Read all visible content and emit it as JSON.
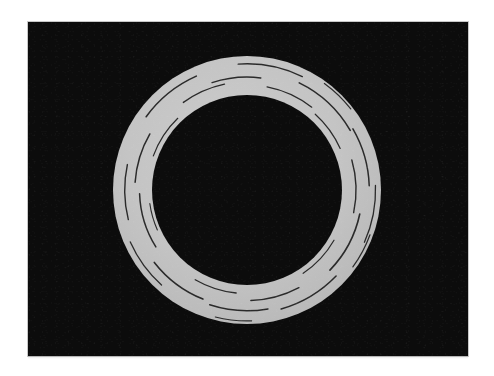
{
  "figure": {
    "caption": "",
    "media_type": "grayscale-photograph"
  },
  "page": {
    "background_color": "#ffffff",
    "border_color": "#c8c8c8"
  },
  "plate": {
    "label": "image-plate",
    "background_color": "#0c0c0c",
    "x": 28,
    "y": 22,
    "width": 440,
    "height": 334,
    "noise": "film-grain"
  },
  "chart_data": {
    "type": "scatter",
    "xlabel": "",
    "ylabel": "",
    "grid": false,
    "legend_position": "none",
    "xlim": [
      0,
      440
    ],
    "ylim": [
      0,
      334
    ],
    "shapes": [
      {
        "name": "ring",
        "kind": "annulus",
        "center_x": 219,
        "center_y": 168,
        "outer_radius": 134,
        "inner_radius": 95,
        "fill_color": "#c3c3c3",
        "edge_color": "#b5b5b5"
      }
    ],
    "scratches": [
      {
        "id": 1,
        "start_angle": 252,
        "end_angle": 277,
        "radius_fraction": 0.46,
        "width": 1.5
      },
      {
        "id": 2,
        "start_angle": 266,
        "end_angle": 296,
        "radius_fraction": 0.8,
        "width": 1.4
      },
      {
        "id": 3,
        "start_angle": 281,
        "end_angle": 308,
        "radius_fraction": 0.26,
        "width": 1.3
      },
      {
        "id": 4,
        "start_angle": 296,
        "end_angle": 330,
        "radius_fraction": 0.62,
        "width": 1.6
      },
      {
        "id": 5,
        "start_angle": 312,
        "end_angle": 336,
        "radius_fraction": 0.18,
        "width": 1.2
      },
      {
        "id": 6,
        "start_angle": 330,
        "end_angle": 358,
        "radius_fraction": 0.7,
        "width": 1.5
      },
      {
        "id": 7,
        "start_angle": 344,
        "end_angle": 372,
        "radius_fraction": 0.36,
        "width": 1.4
      },
      {
        "id": 8,
        "start_angle": 358,
        "end_angle": 384,
        "radius_fraction": 0.86,
        "width": 1.3
      },
      {
        "id": 9,
        "start_angle": 12,
        "end_angle": 44,
        "radius_fraction": 0.52,
        "width": 1.6
      },
      {
        "id": 10,
        "start_angle": 30,
        "end_angle": 56,
        "radius_fraction": 0.14,
        "width": 1.2
      },
      {
        "id": 11,
        "start_angle": 44,
        "end_angle": 74,
        "radius_fraction": 0.74,
        "width": 1.5
      },
      {
        "id": 12,
        "start_angle": 62,
        "end_angle": 88,
        "radius_fraction": 0.4,
        "width": 1.4
      },
      {
        "id": 13,
        "start_angle": 80,
        "end_angle": 108,
        "radius_fraction": 0.66,
        "width": 1.5
      },
      {
        "id": 14,
        "start_angle": 96,
        "end_angle": 120,
        "radius_fraction": 0.22,
        "width": 1.3
      },
      {
        "id": 15,
        "start_angle": 112,
        "end_angle": 142,
        "radius_fraction": 0.58,
        "width": 1.6
      },
      {
        "id": 16,
        "start_angle": 132,
        "end_angle": 156,
        "radius_fraction": 0.84,
        "width": 1.3
      },
      {
        "id": 17,
        "start_angle": 148,
        "end_angle": 178,
        "radius_fraction": 0.32,
        "width": 1.5
      },
      {
        "id": 18,
        "start_angle": 166,
        "end_angle": 192,
        "radius_fraction": 0.7,
        "width": 1.4
      },
      {
        "id": 19,
        "start_angle": 184,
        "end_angle": 210,
        "radius_fraction": 0.44,
        "width": 1.5
      },
      {
        "id": 20,
        "start_angle": 200,
        "end_angle": 226,
        "radius_fraction": 0.12,
        "width": 1.2
      },
      {
        "id": 21,
        "start_angle": 216,
        "end_angle": 246,
        "radius_fraction": 0.76,
        "width": 1.6
      },
      {
        "id": 22,
        "start_angle": 234,
        "end_angle": 258,
        "radius_fraction": 0.34,
        "width": 1.4
      },
      {
        "id": 23,
        "start_angle": 88,
        "end_angle": 104,
        "radius_fraction": 0.92,
        "width": 1.2
      },
      {
        "id": 24,
        "start_angle": 156,
        "end_angle": 172,
        "radius_fraction": 0.08,
        "width": 1.1
      },
      {
        "id": 25,
        "start_angle": 306,
        "end_angle": 322,
        "radius_fraction": 0.94,
        "width": 1.2
      },
      {
        "id": 26,
        "start_angle": 20,
        "end_angle": 36,
        "radius_fraction": 0.92,
        "width": 1.2
      }
    ],
    "colors": {
      "ring": "#c3c3c3",
      "background": "#0c0c0c",
      "scratch": "#2a2a2a"
    }
  }
}
